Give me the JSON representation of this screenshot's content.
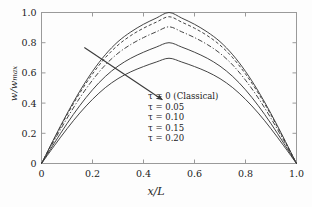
{
  "chart_data": {
    "type": "line",
    "title": "",
    "xlabel": "x/L",
    "ylabel": "w/w_max",
    "xlim": [
      0,
      1.0
    ],
    "ylim": [
      0,
      1.0
    ],
    "xticks": [
      "0",
      "0.2",
      "0.4",
      "0.6",
      "0.8",
      "1.0"
    ],
    "xtick_values": [
      0,
      0.2,
      0.4,
      0.6,
      0.8,
      1.0
    ],
    "yticks": [
      "0",
      "0.2",
      "0.4",
      "0.6",
      "0.8",
      "1.0"
    ],
    "ytick_values": [
      0,
      0.2,
      0.4,
      0.6,
      0.8,
      1.0
    ],
    "grid": false,
    "legend_position": "center-right-inside",
    "series": [
      {
        "name": "τ = 0 (Classical)",
        "tau": 0,
        "style": "solid",
        "peak": 1.0,
        "x": [
          0,
          0.05,
          0.1,
          0.15,
          0.2,
          0.25,
          0.3,
          0.35,
          0.4,
          0.45,
          0.5,
          0.55,
          0.6,
          0.65,
          0.7,
          0.75,
          0.8,
          0.85,
          0.9,
          0.95,
          1.0
        ],
        "values": [
          0,
          0.168,
          0.33,
          0.479,
          0.61,
          0.72,
          0.807,
          0.871,
          0.922,
          0.963,
          1.0,
          0.963,
          0.922,
          0.871,
          0.807,
          0.72,
          0.61,
          0.479,
          0.33,
          0.168,
          0
        ]
      },
      {
        "name": "τ = 0.05",
        "tau": 0.05,
        "style": "dashed",
        "peak": 0.972,
        "x": [
          0,
          0.05,
          0.1,
          0.15,
          0.2,
          0.25,
          0.3,
          0.35,
          0.4,
          0.45,
          0.5,
          0.55,
          0.6,
          0.65,
          0.7,
          0.75,
          0.8,
          0.85,
          0.9,
          0.95,
          1.0
        ],
        "values": [
          0,
          0.163,
          0.321,
          0.466,
          0.593,
          0.7,
          0.784,
          0.847,
          0.896,
          0.936,
          0.972,
          0.936,
          0.896,
          0.847,
          0.784,
          0.7,
          0.593,
          0.466,
          0.321,
          0.163,
          0
        ]
      },
      {
        "name": "τ = 0.10",
        "tau": 0.1,
        "style": "dash-dot",
        "peak": 0.905,
        "x": [
          0,
          0.05,
          0.1,
          0.15,
          0.2,
          0.25,
          0.3,
          0.35,
          0.4,
          0.45,
          0.5,
          0.55,
          0.6,
          0.65,
          0.7,
          0.75,
          0.8,
          0.85,
          0.9,
          0.95,
          1.0
        ],
        "values": [
          0,
          0.152,
          0.299,
          0.434,
          0.552,
          0.652,
          0.73,
          0.788,
          0.834,
          0.872,
          0.905,
          0.872,
          0.834,
          0.788,
          0.73,
          0.652,
          0.552,
          0.434,
          0.299,
          0.152,
          0
        ]
      },
      {
        "name": "τ = 0.15",
        "tau": 0.15,
        "style": "solid",
        "peak": 0.8,
        "x": [
          0,
          0.05,
          0.1,
          0.15,
          0.2,
          0.25,
          0.3,
          0.35,
          0.4,
          0.45,
          0.5,
          0.55,
          0.6,
          0.65,
          0.7,
          0.75,
          0.8,
          0.85,
          0.9,
          0.95,
          1.0
        ],
        "values": [
          0,
          0.134,
          0.264,
          0.383,
          0.488,
          0.576,
          0.645,
          0.697,
          0.737,
          0.771,
          0.8,
          0.771,
          0.737,
          0.697,
          0.645,
          0.576,
          0.488,
          0.383,
          0.264,
          0.134,
          0
        ]
      },
      {
        "name": "τ = 0.20",
        "tau": 0.2,
        "style": "solid",
        "peak": 0.697,
        "x": [
          0,
          0.05,
          0.1,
          0.15,
          0.2,
          0.25,
          0.3,
          0.35,
          0.4,
          0.45,
          0.5,
          0.55,
          0.6,
          0.65,
          0.7,
          0.75,
          0.8,
          0.85,
          0.9,
          0.95,
          1.0
        ],
        "values": [
          0,
          0.117,
          0.23,
          0.334,
          0.425,
          0.502,
          0.562,
          0.607,
          0.642,
          0.672,
          0.697,
          0.672,
          0.642,
          0.607,
          0.562,
          0.502,
          0.425,
          0.334,
          0.23,
          0.117,
          0
        ]
      }
    ],
    "annotations": [
      {
        "name": "increasing-tau-arrow",
        "type": "arrow",
        "from": [
          0.168,
          0.768
        ],
        "to": [
          0.474,
          0.422
        ]
      }
    ],
    "legend_entries": [
      "τ = 0 (Classical)",
      "τ = 0.05",
      "τ = 0.10",
      "τ = 0.15",
      "τ = 0.20"
    ],
    "colors": {
      "line": "#3a3a3a",
      "axis": "#9a9a9a",
      "text": "#222222",
      "background": "#fdfdfd"
    }
  }
}
